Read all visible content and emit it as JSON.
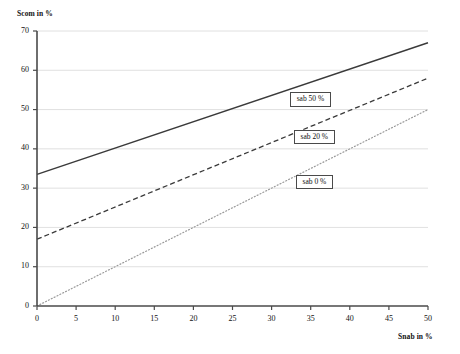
{
  "chart_data": {
    "type": "line",
    "title": "",
    "xlabel": "Snab in %",
    "ylabel": "Scom in %",
    "xlim": [
      0,
      50
    ],
    "ylim": [
      0,
      70
    ],
    "xticks": [
      0,
      5,
      10,
      15,
      20,
      25,
      30,
      35,
      40,
      45,
      50
    ],
    "yticks": [
      0,
      10,
      20,
      30,
      40,
      50,
      60,
      70
    ],
    "grid": "horizontal",
    "legend_position": "inline-labels-on-lines",
    "x": [
      0,
      50
    ],
    "series": [
      {
        "name": "sab 50 %",
        "values": [
          33.5,
          67.0
        ],
        "style": "solid",
        "color": "#3a3a3a",
        "label_x": 35.0,
        "label_y": 52.5
      },
      {
        "name": "sab 20 %",
        "values": [
          17.0,
          58.0
        ],
        "style": "dashed",
        "color": "#3a3a3a",
        "label_x": 35.5,
        "label_y": 43.0
      },
      {
        "name": "sab 0 %",
        "values": [
          0.0,
          50.0
        ],
        "style": "dotted",
        "color": "#9a9a9a",
        "label_x": 35.5,
        "label_y": 31.5
      }
    ],
    "annotations": [
      {
        "text": "sab 50 %",
        "on_series": "sab 50 %"
      },
      {
        "text": "sab 20 %",
        "on_series": "sab 20 %"
      },
      {
        "text": "sab 0 %",
        "on_series": "sab 0 %"
      }
    ]
  },
  "axes": {
    "y_title": "Scom in %",
    "x_title": "Snab in %",
    "y_tick_labels": [
      "0",
      "10",
      "20",
      "30",
      "40",
      "50",
      "60",
      "70"
    ],
    "x_tick_labels": [
      "0",
      "5",
      "10",
      "15",
      "20",
      "25",
      "30",
      "35",
      "40",
      "45",
      "50"
    ]
  },
  "colors": {
    "axis": "#4a4a4a",
    "grid": "#d8d8d8",
    "solid_line": "#3a3a3a",
    "dashed_line": "#3a3a3a",
    "dotted_line": "#9a9a9a",
    "text": "#111111",
    "background": "#ffffff"
  }
}
